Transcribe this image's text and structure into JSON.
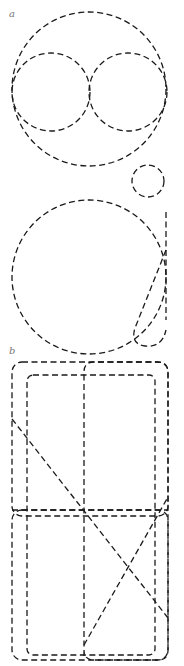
{
  "panels": [
    {
      "label": "a",
      "label_pos": [
        9,
        9
      ]
    },
    {
      "label": "b",
      "label_pos": [
        9,
        346
      ]
    }
  ],
  "colors": {
    "stroke": "#1a1a1a",
    "label": "#777777",
    "background": "#ffffff"
  }
}
